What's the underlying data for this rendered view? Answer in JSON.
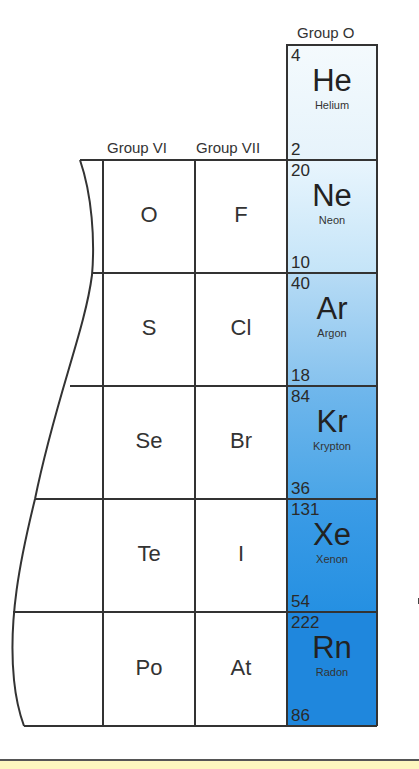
{
  "headers": {
    "group_o": "Group O",
    "group_vi": "Group VI",
    "group_vii": "Group VII"
  },
  "group_vi": [
    {
      "symbol": "O"
    },
    {
      "symbol": "S"
    },
    {
      "symbol": "Se"
    },
    {
      "symbol": "Te"
    },
    {
      "symbol": "Po"
    }
  ],
  "group_vii": [
    {
      "symbol": "F"
    },
    {
      "symbol": "Cl"
    },
    {
      "symbol": "Br"
    },
    {
      "symbol": "I"
    },
    {
      "symbol": "At"
    }
  ],
  "noble_gases": [
    {
      "mass": "4",
      "symbol": "He",
      "name": "Helium",
      "number": "2",
      "color": "#eef7fc"
    },
    {
      "mass": "20",
      "symbol": "Ne",
      "name": "Neon",
      "number": "10",
      "color": "#d6eefb"
    },
    {
      "mass": "40",
      "symbol": "Ar",
      "name": "Argon",
      "number": "18",
      "color": "#9fcff1"
    },
    {
      "mass": "84",
      "symbol": "Kr",
      "name": "Krypton",
      "number": "36",
      "color": "#5cb0ea"
    },
    {
      "mass": "131",
      "symbol": "Xe",
      "name": "Xenon",
      "number": "54",
      "color": "#2d94e3"
    },
    {
      "mass": "222",
      "symbol": "Rn",
      "name": "Radon",
      "number": "86",
      "color": "#1f86dc"
    }
  ]
}
